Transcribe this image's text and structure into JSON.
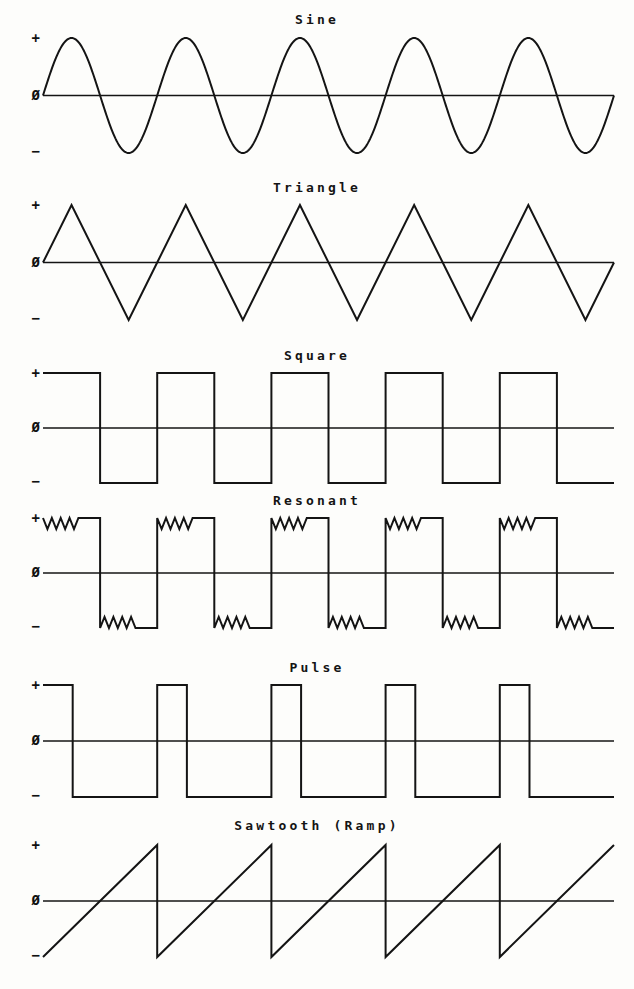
{
  "page": {
    "background": "#fdfdfb",
    "ink": "#141414",
    "width": 634,
    "height": 989
  },
  "axis": {
    "plus_label": "+",
    "zero_label": "Ø",
    "minus_label": "−"
  },
  "chart_data": {
    "type": "line",
    "title": "",
    "xlabel": "",
    "ylabel": "",
    "grid": false,
    "legend": null,
    "shared": {
      "cycles": 5,
      "ylim": [
        -1,
        1
      ],
      "ytick_labels": [
        "+",
        "Ø",
        "−"
      ],
      "ytick_values": [
        1,
        0,
        -1
      ],
      "plot_left": 43,
      "plot_width": 571
    },
    "panels": [
      {
        "name": "sine",
        "title": "Sine",
        "shape": "sine",
        "top": 12,
        "plot_top": 38,
        "plot_height": 115,
        "cycles": 5,
        "amplitude": 1.0,
        "phase_deg": 0,
        "description": "Five full sinusoidal cycles starting at zero rising."
      },
      {
        "name": "triangle",
        "title": "Triangle",
        "shape": "triangle",
        "top": 180,
        "plot_top": 205,
        "plot_height": 115,
        "cycles": 5,
        "amplitude": 1.0,
        "description": "Five triangle cycles, linear ramp up from zero to peak, down to trough, back to zero."
      },
      {
        "name": "square",
        "title": "Square",
        "shape": "square",
        "top": 348,
        "plot_top": 373,
        "plot_height": 110,
        "cycles": 5,
        "amplitude": 1.0,
        "duty": 0.5,
        "description": "Five square cycles, 50 percent duty, starting high."
      },
      {
        "name": "resonant",
        "title": "Resonant",
        "shape": "resonant",
        "top": 493,
        "plot_top": 518,
        "plot_height": 110,
        "cycles": 5,
        "amplitude": 1.0,
        "duty": 0.5,
        "ripple_count": 4,
        "ripple_depth": 0.2,
        "description": "Square wave with ringing ripples superimposed on each flat top and bottom."
      },
      {
        "name": "pulse",
        "title": "Pulse",
        "shape": "pulse",
        "top": 660,
        "plot_top": 685,
        "plot_height": 112,
        "cycles": 5,
        "amplitude": 1.0,
        "duty": 0.26,
        "description": "Narrow positive pulses with long negative intervals."
      },
      {
        "name": "sawtooth",
        "title": "Sawtooth (Ramp)",
        "shape": "sawtooth",
        "top": 818,
        "plot_top": 845,
        "plot_height": 112,
        "cycles": 5,
        "amplitude": 1.0,
        "description": "Five ramp cycles rising from negative peak to positive peak then snapping back."
      }
    ]
  }
}
